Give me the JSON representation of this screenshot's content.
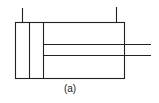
{
  "diagram": {
    "caption": "(a)",
    "stroke_color": "#222222",
    "components": [
      {
        "name": "cylinder-barrel",
        "type": "rectangle"
      },
      {
        "name": "end-cap",
        "type": "section"
      },
      {
        "name": "piston",
        "type": "section"
      },
      {
        "name": "piston-rod",
        "type": "rod"
      },
      {
        "name": "port-cap-end",
        "type": "port"
      },
      {
        "name": "port-rod-end",
        "type": "port"
      }
    ]
  }
}
